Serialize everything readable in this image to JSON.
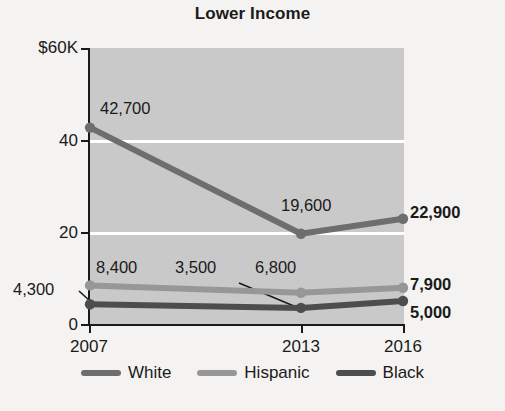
{
  "chart_data": {
    "type": "line",
    "title": "Lower Income",
    "xlabel": "",
    "ylabel": "",
    "categories": [
      "2007",
      "2013",
      "2016"
    ],
    "x": [
      2007,
      2013,
      2016
    ],
    "ylim": [
      0,
      60000
    ],
    "ytick_labels": [
      "$60K",
      "40",
      "20",
      "0"
    ],
    "ytick_values": [
      60000,
      40000,
      20000,
      0
    ],
    "grid": true,
    "gridlines_at": [
      40000,
      20000
    ],
    "legend_position": "bottom",
    "series": [
      {
        "name": "White",
        "color": "#6e6e6e",
        "values": [
          42700,
          19600,
          22900
        ],
        "labels": [
          "42,700",
          "19,600",
          "22,900"
        ]
      },
      {
        "name": "Hispanic",
        "color": "#979797",
        "values": [
          8400,
          6800,
          7900
        ],
        "labels": [
          "8,400",
          "6,800",
          "7,900"
        ]
      },
      {
        "name": "Black",
        "color": "#4d4d4d",
        "values": [
          4300,
          3500,
          5000
        ],
        "labels": [
          "4,300",
          "3,500",
          "5,000"
        ]
      }
    ],
    "point_labels": [
      {
        "text": "42,700",
        "series": "White",
        "category": "2007",
        "bold": false,
        "leader": false
      },
      {
        "text": "19,600",
        "series": "White",
        "category": "2013",
        "bold": false,
        "leader": false
      },
      {
        "text": "22,900",
        "series": "White",
        "category": "2016",
        "bold": true,
        "leader": false
      },
      {
        "text": "8,400",
        "series": "Hispanic",
        "category": "2007",
        "bold": false,
        "leader": false
      },
      {
        "text": "6,800",
        "series": "Hispanic",
        "category": "2013",
        "bold": false,
        "leader": false
      },
      {
        "text": "7,900",
        "series": "Hispanic",
        "category": "2016",
        "bold": true,
        "leader": false
      },
      {
        "text": "4,300",
        "series": "Black",
        "category": "2007",
        "bold": false,
        "leader": true
      },
      {
        "text": "3,500",
        "series": "Black",
        "category": "2013",
        "bold": false,
        "leader": true
      },
      {
        "text": "5,000",
        "series": "Black",
        "category": "2016",
        "bold": true,
        "leader": false
      }
    ],
    "plot_background": "#c9c9c9",
    "gridline_color": "#ffffff",
    "axis_color": "#1a1a1a"
  },
  "legend": {
    "items": [
      {
        "label": "White",
        "color": "#6e6e6e"
      },
      {
        "label": "Hispanic",
        "color": "#979797"
      },
      {
        "label": "Black",
        "color": "#4d4d4d"
      }
    ]
  },
  "axis": {
    "y_labels": [
      "$60K",
      "40",
      "20",
      "0"
    ],
    "x_labels": [
      "2007",
      "2013",
      "2016"
    ]
  }
}
